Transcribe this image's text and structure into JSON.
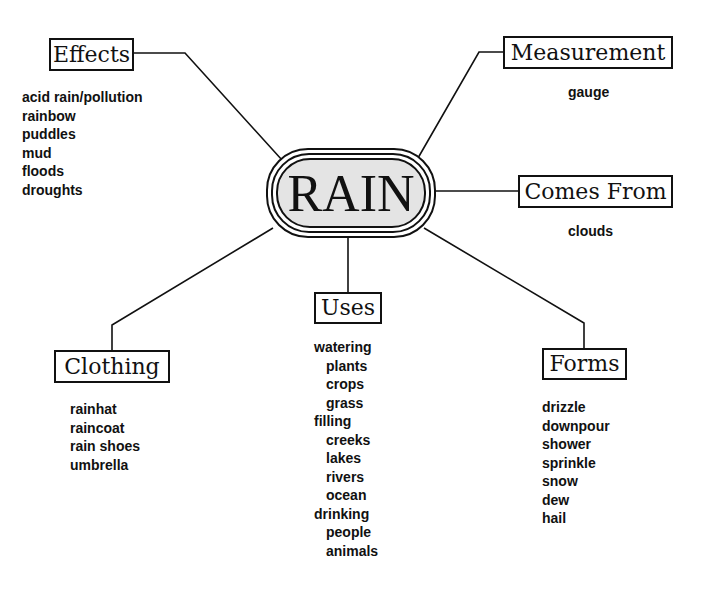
{
  "center": {
    "label": "RAIN"
  },
  "branches": {
    "effects": {
      "title": "Effects",
      "items": [
        "acid rain/pollution",
        "rainbow",
        "puddles",
        "mud",
        "floods",
        "droughts"
      ]
    },
    "measurement": {
      "title": "Measurement",
      "items": [
        "gauge"
      ]
    },
    "comes_from": {
      "title": "Comes From",
      "items": [
        "clouds"
      ]
    },
    "clothing": {
      "title": "Clothing",
      "items": [
        "rainhat",
        "raincoat",
        "rain shoes",
        "umbrella"
      ]
    },
    "uses": {
      "title": "Uses",
      "items": [
        {
          "text": "watering",
          "level": 0
        },
        {
          "text": "plants",
          "level": 1
        },
        {
          "text": "crops",
          "level": 1
        },
        {
          "text": "grass",
          "level": 1
        },
        {
          "text": "filling",
          "level": 0
        },
        {
          "text": "creeks",
          "level": 1
        },
        {
          "text": "lakes",
          "level": 1
        },
        {
          "text": "rivers",
          "level": 1
        },
        {
          "text": "ocean",
          "level": 1
        },
        {
          "text": "drinking",
          "level": 0
        },
        {
          "text": "people",
          "level": 1
        },
        {
          "text": "animals",
          "level": 1
        }
      ]
    },
    "forms": {
      "title": "Forms",
      "items": [
        "drizzle",
        "downpour",
        "shower",
        "sprinkle",
        "snow",
        "dew",
        "hail"
      ]
    }
  },
  "colors": {
    "ink": "#111111",
    "center_fill": "#e4e4e4",
    "background": "#ffffff"
  }
}
